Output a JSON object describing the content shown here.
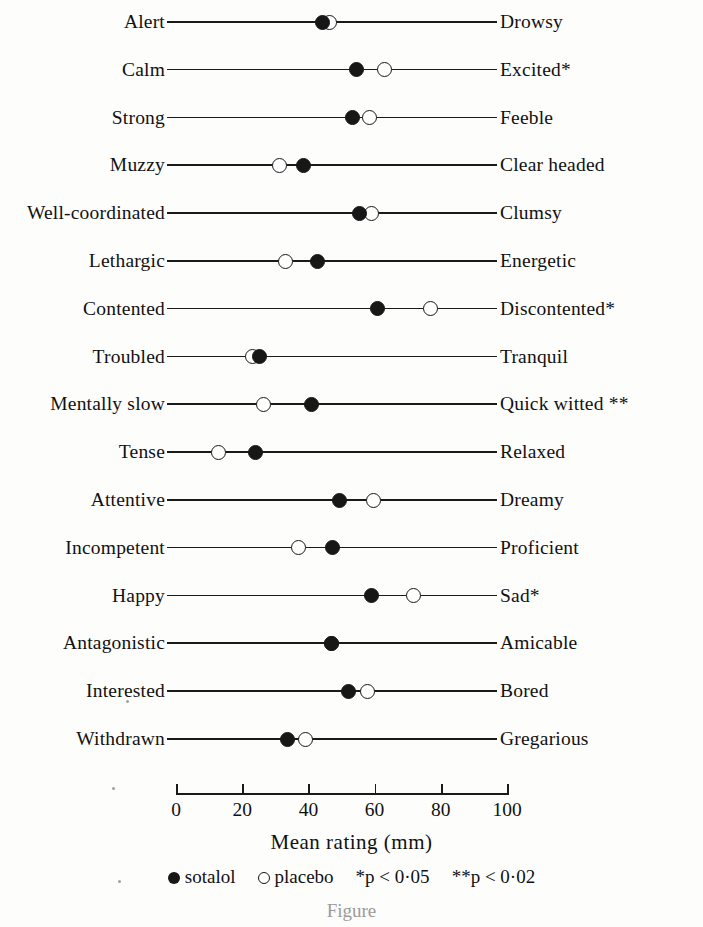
{
  "chart_data": {
    "type": "scatter",
    "title": "",
    "xlabel": "Mean rating (mm)",
    "ylabel": "",
    "xlim": [
      0,
      100
    ],
    "xticks": [
      0,
      20,
      40,
      60,
      80,
      100
    ],
    "grid": false,
    "legend_position": "bottom",
    "series": [
      {
        "name": "sotalol",
        "marker": "filled-circle",
        "values": [
          44.4,
          54.4,
          53.2,
          38.4,
          55.3,
          42.9,
          61.0,
          25.2,
          40.8,
          23.9,
          49.3,
          47.4,
          59.2,
          47.0,
          52.0,
          33.8
        ]
      },
      {
        "name": "placebo",
        "marker": "open-circle",
        "values": [
          46.5,
          63.1,
          58.6,
          31.4,
          59.2,
          33.0,
          77.0,
          23.0,
          26.3,
          12.7,
          59.8,
          36.9,
          71.9,
          47.0,
          58.0,
          39.0
        ]
      }
    ],
    "categories": [
      "Alert — Drowsy",
      "Calm — Excited*",
      "Strong — Feeble",
      "Muzzy — Clear headed",
      "Well-coordinated — Clumsy",
      "Lethargic — Energetic",
      "Contented — Discontented*",
      "Troubled — Tranquil",
      "Mentally slow — Quick witted **",
      "Tense — Relaxed",
      "Attentive — Dreamy",
      "Incompetent — Proficient",
      "Happy — Sad*",
      "Antagonistic — Amicable",
      "Interested — Bored",
      "Withdrawn — Gregarious"
    ],
    "annotations": [
      "*p < 0·05",
      "**p < 0·02"
    ]
  },
  "rows": [
    {
      "left": "Alert",
      "right": "Drowsy",
      "sotalol": 44.4,
      "placebo": 46.5
    },
    {
      "left": "Calm",
      "right": "Excited*",
      "sotalol": 54.4,
      "placebo": 63.1
    },
    {
      "left": "Strong",
      "right": "Feeble",
      "sotalol": 53.2,
      "placebo": 58.6
    },
    {
      "left": "Muzzy",
      "right": "Clear headed",
      "sotalol": 38.4,
      "placebo": 31.4
    },
    {
      "left": "Well-coordinated",
      "right": "Clumsy",
      "sotalol": 55.3,
      "placebo": 59.2
    },
    {
      "left": "Lethargic",
      "right": "Energetic",
      "sotalol": 42.9,
      "placebo": 33.0
    },
    {
      "left": "Contented",
      "right": "Discontented*",
      "sotalol": 61.0,
      "placebo": 77.0
    },
    {
      "left": "Troubled",
      "right": "Tranquil",
      "sotalol": 25.2,
      "placebo": 23.0
    },
    {
      "left": "Mentally slow",
      "right": "Quick witted **",
      "sotalol": 40.8,
      "placebo": 26.3
    },
    {
      "left": "Tense",
      "right": "Relaxed",
      "sotalol": 23.9,
      "placebo": 12.7
    },
    {
      "left": "Attentive",
      "right": "Dreamy",
      "sotalol": 49.3,
      "placebo": 59.8
    },
    {
      "left": "Incompetent",
      "right": "Proficient",
      "sotalol": 47.4,
      "placebo": 36.9
    },
    {
      "left": "Happy",
      "right": "Sad*",
      "sotalol": 59.2,
      "placebo": 71.9
    },
    {
      "left": "Antagonistic",
      "right": "Amicable",
      "sotalol": 47.0,
      "placebo": 47.0
    },
    {
      "left": "Interested",
      "right": "Bored",
      "sotalol": 52.0,
      "placebo": 58.0
    },
    {
      "left": "Withdrawn",
      "right": "Gregarious",
      "sotalol": 33.8,
      "placebo": 39.0
    }
  ],
  "axis": {
    "ticks": [
      "0",
      "20",
      "40",
      "60",
      "80",
      "100"
    ],
    "tick_values": [
      0,
      20,
      40,
      60,
      80,
      100
    ],
    "title": "Mean rating (mm)"
  },
  "legend": {
    "sotalol_label": "sotalol",
    "placebo_label": "placebo",
    "p1": "*p < 0·05",
    "p2": "**p < 0·02"
  },
  "caption": "Figure",
  "colors": {
    "ink": "#171717",
    "paper": "#fdfdfc"
  }
}
